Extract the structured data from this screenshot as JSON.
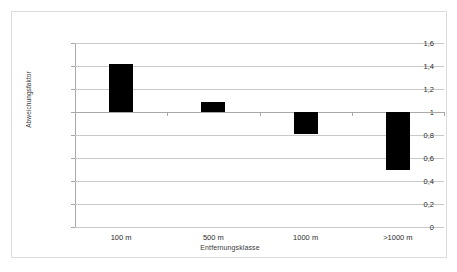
{
  "chart_data": {
    "type": "bar",
    "title": "",
    "subtitle": "",
    "xlabel": "Entfernungsklasse",
    "ylabel": "Abweichungsfaktor",
    "categories": [
      "100 m",
      "500 m",
      "1000 m",
      ">1000 m"
    ],
    "bar_style": "floating range bars anchored at baseline value 1",
    "baseline": 1,
    "series": [
      {
        "name": "Abweichungsfaktor",
        "color": "#000000",
        "low": [
          1.0,
          1.0,
          0.81,
          0.5
        ],
        "high": [
          1.42,
          1.09,
          1.0,
          1.0
        ],
        "values": [
          1.42,
          1.09,
          0.81,
          0.5
        ]
      }
    ],
    "ylim": [
      0,
      1.6
    ],
    "ytick_labels": [
      "1,6",
      "1,4",
      "1,2",
      "1",
      "0,8",
      "0,6",
      "0,4",
      "0,2",
      "0"
    ],
    "ytick_values": [
      1.6,
      1.4,
      1.2,
      1.0,
      0.8,
      0.6,
      0.4,
      0.2,
      0
    ],
    "grid": "horizontal",
    "legend": "none",
    "legend_position": "none",
    "background_color": "#ffffff",
    "gridline_color": "#c9c9c9",
    "frame_color": "#dcdcdc"
  }
}
